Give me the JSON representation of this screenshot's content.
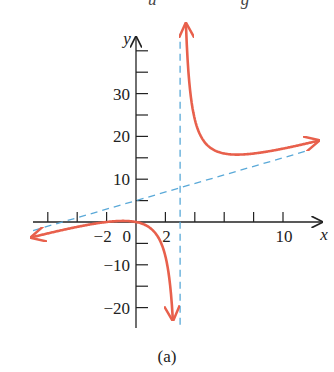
{
  "top_cut_text": "u  g",
  "caption": "(a)",
  "chart_data": {
    "type": "line",
    "title": "",
    "xlabel": "x",
    "ylabel": "y",
    "xlim": [
      -7,
      12.5
    ],
    "ylim": [
      -24,
      46
    ],
    "grid": false,
    "x_ticks": [
      -6,
      -4,
      -2,
      2,
      4,
      6,
      8,
      10
    ],
    "x_tick_labels": [
      {
        "value": -2,
        "label": "−2"
      },
      {
        "value": 2,
        "label": "2"
      },
      {
        "value": 10,
        "label": "10"
      }
    ],
    "y_ticks": [
      -20,
      -15,
      -10,
      -5,
      5,
      10,
      15,
      20,
      25,
      30,
      35,
      40
    ],
    "y_tick_labels": [
      {
        "value": 30,
        "label": "30"
      },
      {
        "value": 20,
        "label": "20"
      },
      {
        "value": 10,
        "label": "10"
      },
      {
        "value": -10,
        "label": "−10"
      },
      {
        "value": -20,
        "label": "−20"
      }
    ],
    "origin_label": "0",
    "function": "y = (x^2 + 2x)/(x - 3)",
    "series": [
      {
        "name": "curve-left-branch",
        "color": "#e8604c",
        "x": [
          -7,
          -6,
          -5,
          -4,
          -3,
          -2,
          -1,
          0,
          1,
          1.5,
          2,
          2.25,
          2.5
        ],
        "y": [
          -3.5,
          -2.67,
          -1.88,
          -1.14,
          -0.5,
          0,
          0.25,
          0,
          -1.5,
          -3.5,
          -8,
          -13.5,
          -22.5
        ]
      },
      {
        "name": "curve-right-branch",
        "color": "#e8604c",
        "x": [
          3.4,
          3.6,
          4,
          4.5,
          5,
          6,
          7,
          8,
          9,
          10,
          11,
          12.3
        ],
        "y": [
          46.6,
          35.6,
          24,
          19.5,
          17.5,
          16,
          15.75,
          16,
          16.5,
          17.1,
          17.9,
          19.2
        ]
      },
      {
        "name": "vertical-asymptote",
        "style": "dashed",
        "color": "#5aa9d8",
        "x": [
          3,
          3
        ],
        "y": [
          -24,
          44
        ]
      },
      {
        "name": "slant-asymptote",
        "style": "dashed",
        "color": "#5aa9d8",
        "equation": "y = x + 5",
        "x": [
          -7,
          11.8
        ],
        "y": [
          -2,
          16.8
        ]
      }
    ]
  }
}
